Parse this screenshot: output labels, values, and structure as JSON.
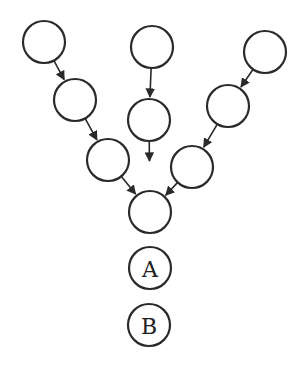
{
  "diagram": {
    "type": "converging-chain-graph",
    "colors": {
      "stroke": "#2a2a2a",
      "background": "#ffffff"
    },
    "nodes": [
      {
        "id": "l1",
        "x": 44,
        "y": 42,
        "r": 21,
        "label": ""
      },
      {
        "id": "l2",
        "x": 75,
        "y": 100,
        "r": 21,
        "label": ""
      },
      {
        "id": "l3",
        "x": 108,
        "y": 160,
        "r": 21,
        "label": ""
      },
      {
        "id": "m1",
        "x": 152,
        "y": 47,
        "r": 21,
        "label": ""
      },
      {
        "id": "m2",
        "x": 149,
        "y": 120,
        "r": 21,
        "label": ""
      },
      {
        "id": "r1",
        "x": 265,
        "y": 52,
        "r": 21,
        "label": ""
      },
      {
        "id": "r2",
        "x": 228,
        "y": 106,
        "r": 21,
        "label": ""
      },
      {
        "id": "r3",
        "x": 192,
        "y": 167,
        "r": 21,
        "label": ""
      },
      {
        "id": "c",
        "x": 150,
        "y": 212,
        "r": 21,
        "label": ""
      },
      {
        "id": "a",
        "x": 150,
        "y": 268,
        "r": 21,
        "label": "A"
      },
      {
        "id": "b",
        "x": 149,
        "y": 325,
        "r": 21,
        "label": "B"
      }
    ],
    "edges": [
      {
        "from": "l1",
        "to": "l2"
      },
      {
        "from": "l2",
        "to": "l3"
      },
      {
        "from": "l3",
        "to": "c"
      },
      {
        "from": "m1",
        "to": "m2"
      },
      {
        "from": "m2",
        "to": "c",
        "partial": true
      },
      {
        "from": "r1",
        "to": "r2"
      },
      {
        "from": "r2",
        "to": "r3"
      },
      {
        "from": "r3",
        "to": "c"
      }
    ],
    "labels": {
      "a": "A",
      "b": "B"
    }
  }
}
